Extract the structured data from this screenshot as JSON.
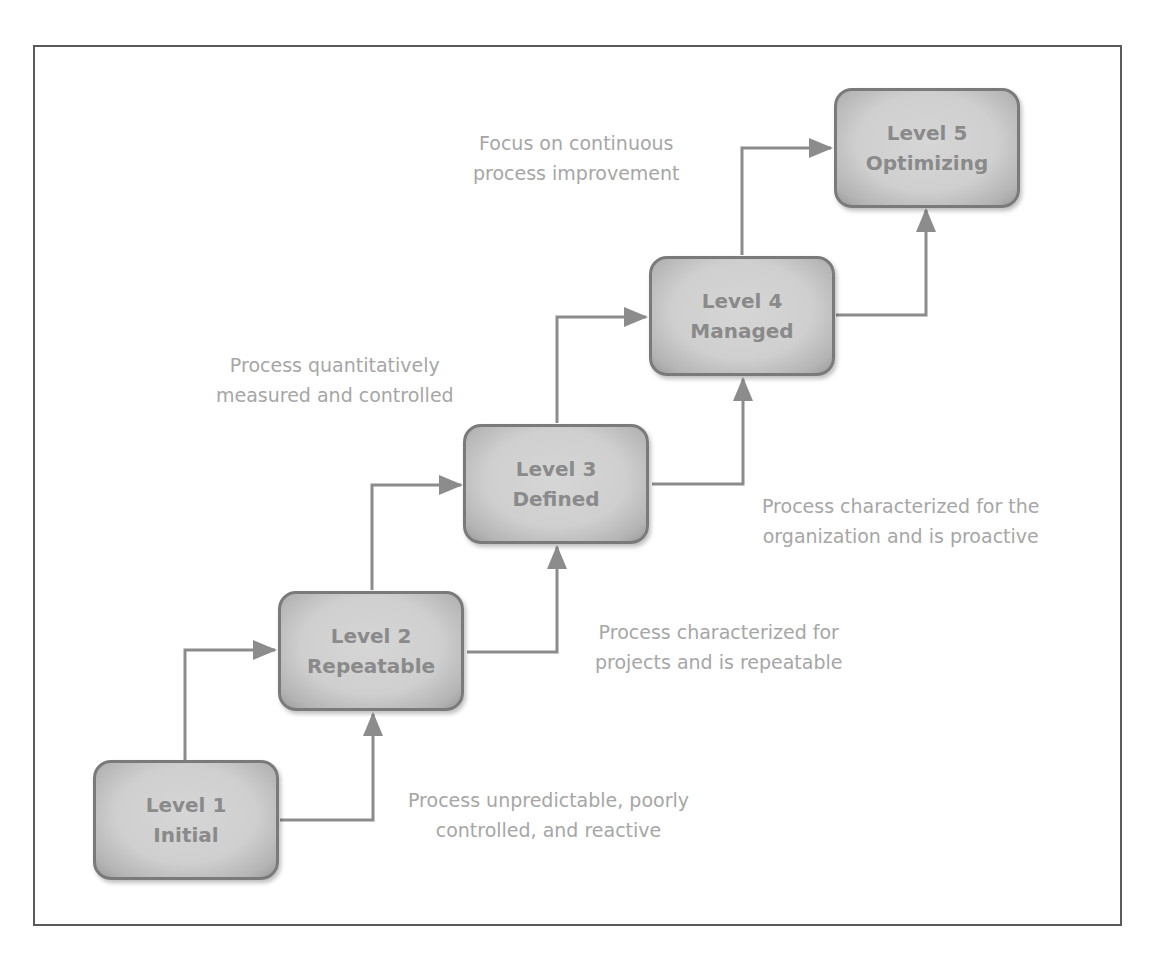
{
  "diagram": {
    "type": "staircase maturity model",
    "colors": {
      "box_fill": "#cfcfcf",
      "box_border": "#7a7a7a",
      "box_text": "#8a8a8a",
      "description_text": "#a6a6a6",
      "connector": "#8c8c8c",
      "frame": "#5a5a5a"
    },
    "levels": [
      {
        "line1": "Level 1",
        "line2": "Initial",
        "description": [
          "Process unpredictable, poorly",
          "controlled, and reactive"
        ]
      },
      {
        "line1": "Level 2",
        "line2": "Repeatable",
        "description": [
          "Process characterized for",
          "projects and is repeatable"
        ]
      },
      {
        "line1": "Level 3",
        "line2": "Defined",
        "description": [
          "Process characterized for the",
          "organization and is proactive"
        ]
      },
      {
        "line1": "Level 4",
        "line2": "Managed",
        "description": [
          "Process quantitatively",
          "measured and controlled"
        ]
      },
      {
        "line1": "Level 5",
        "line2": "Optimizing",
        "description": [
          "Focus on continuous",
          "process improvement"
        ]
      }
    ]
  }
}
